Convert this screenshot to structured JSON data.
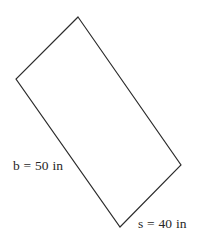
{
  "figure": {
    "shape_type": "rectangle",
    "background_color": "#ffffff",
    "stroke_color": "#2b2b2b",
    "fill_color": "#ffffff",
    "stroke_width": 1.15,
    "vertices": [
      {
        "name": "top-vertex",
        "x": 78,
        "y": 17
      },
      {
        "name": "right-vertex",
        "x": 181,
        "y": 165
      },
      {
        "name": "bottom-vertex",
        "x": 120,
        "y": 227
      },
      {
        "name": "left-vertex",
        "x": 16,
        "y": 79
      }
    ],
    "polygon_points": "78,17 181,165 120,227 16,79"
  },
  "labels": {
    "base": {
      "text": "b = 50 in",
      "variable": "b",
      "value": 50,
      "unit": "in",
      "describes_edge": "left-vertex-to-bottom-vertex"
    },
    "side": {
      "text": "s = 40 in",
      "variable": "s",
      "value": 40,
      "unit": "in",
      "describes_edge": "bottom-vertex-to-right-vertex"
    }
  }
}
